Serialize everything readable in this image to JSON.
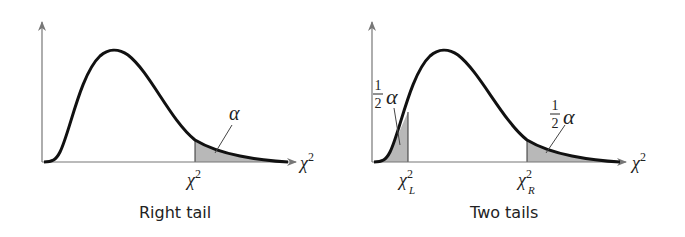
{
  "panels": [
    {
      "id": "right-tail",
      "caption": "Right tail",
      "x_axis_label": "χ",
      "x_axis_label_sup": "2",
      "critical_value_label": "χ",
      "critical_value_sup": "2",
      "area_label": "α"
    },
    {
      "id": "two-tails",
      "caption": "Two tails",
      "x_axis_label": "χ",
      "x_axis_label_sup": "2",
      "left_critical_label": "χ",
      "left_critical_sup": "2",
      "left_critical_sub": "L",
      "right_critical_label": "χ",
      "right_critical_sup": "2",
      "right_critical_sub": "R",
      "area_fraction_num": "1",
      "area_fraction_den": "2",
      "area_label": "α"
    }
  ],
  "colors": {
    "curve": "#111111",
    "axis": "#777777",
    "shade": "#b8b8b8"
  }
}
